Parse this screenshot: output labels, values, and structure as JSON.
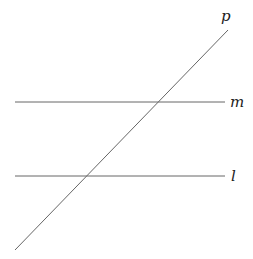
{
  "diagram": {
    "stroke_color": "#666666",
    "label_color": "#222222",
    "lines": [
      {
        "id": "p",
        "label": "p",
        "x1": 15,
        "y1": 250,
        "x2": 228,
        "y2": 30,
        "label_x": 221,
        "label_y": 21
      },
      {
        "id": "m",
        "label": "m",
        "x1": 15,
        "y1": 102,
        "x2": 225,
        "y2": 102,
        "label_x": 230,
        "label_y": 107
      },
      {
        "id": "l",
        "label": "l",
        "x1": 15,
        "y1": 176,
        "x2": 225,
        "y2": 176,
        "label_x": 231,
        "label_y": 181
      }
    ]
  }
}
